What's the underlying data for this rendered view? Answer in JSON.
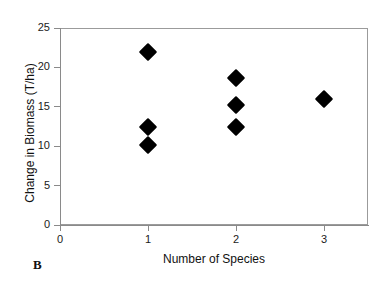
{
  "figure": {
    "panel_label": "B",
    "background_color": "#ffffff",
    "axis_color": "#8a8a8a",
    "marker_color": "#000000"
  },
  "chart_data": {
    "type": "scatter",
    "title": "",
    "xlabel": "Number of Species",
    "ylabel": "Change in Biomass (T/ha)",
    "xlim": [
      0,
      3.5
    ],
    "ylim": [
      0,
      25
    ],
    "xticks": [
      0,
      1,
      2,
      3
    ],
    "xtick_labels": [
      "0",
      "1",
      "2",
      "3"
    ],
    "yticks": [
      0,
      5,
      10,
      15,
      20,
      25
    ],
    "ytick_labels": [
      "0",
      "5",
      "10",
      "15",
      "20",
      "25"
    ],
    "grid": false,
    "legend": false,
    "marker": "filled-diamond",
    "series": [
      {
        "name": "Change in Biomass",
        "points": [
          {
            "x": 1,
            "y": 22.0
          },
          {
            "x": 1,
            "y": 12.5
          },
          {
            "x": 1,
            "y": 10.2
          },
          {
            "x": 2,
            "y": 18.7
          },
          {
            "x": 2,
            "y": 15.2
          },
          {
            "x": 2,
            "y": 12.5
          },
          {
            "x": 3,
            "y": 16.0
          }
        ]
      }
    ]
  }
}
